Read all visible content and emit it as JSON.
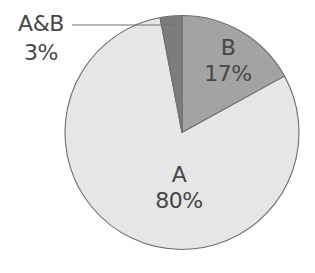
{
  "chart_data": {
    "type": "pie",
    "title": "",
    "categories": [
      "B",
      "A",
      "A&B"
    ],
    "values": [
      17,
      80,
      3
    ],
    "unit": "%",
    "start_angle_deg": 0,
    "direction": "clockwise",
    "slices": [
      {
        "name": "B",
        "value": 17,
        "label": "B",
        "pct_label": "17%",
        "color": "#a3a3a3"
      },
      {
        "name": "A",
        "value": 80,
        "label": "A",
        "pct_label": "80%",
        "color": "#e6e6e6"
      },
      {
        "name": "A&B",
        "value": 3,
        "label": "A&B",
        "pct_label": "3%",
        "color": "#7c7c7c"
      }
    ],
    "annotations": [
      {
        "text": "A&B 3%",
        "type": "leader-line",
        "target": "A&B"
      }
    ],
    "legend": "none",
    "outline_color": "#6e6e6e"
  },
  "labels": {
    "b_name": "B",
    "b_pct": "17%",
    "a_name": "A",
    "a_pct": "80%",
    "ab_name": "A&B",
    "ab_pct": "3%"
  }
}
